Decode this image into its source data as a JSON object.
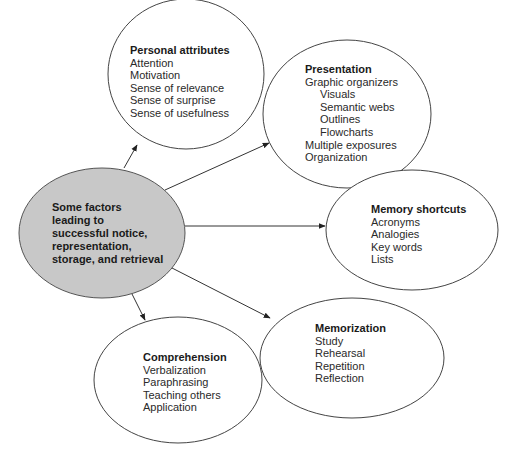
{
  "center": {
    "lines": [
      "Some factors",
      "leading to",
      "successful notice,",
      "representation,",
      "storage, and retrieval"
    ],
    "fill": "#c8c8c8"
  },
  "nodes": {
    "personal": {
      "title": "Personal attributes",
      "items": [
        "Attention",
        "Motivation",
        "Sense of relevance",
        "Sense of surprise",
        "Sense of usefulness"
      ]
    },
    "presentation": {
      "title": "Presentation",
      "items": [
        "Graphic organizers",
        "Visuals",
        "Semantic webs",
        "Outlines",
        "Flowcharts",
        "Multiple exposures",
        "Organization"
      ]
    },
    "memory": {
      "title": "Memory shortcuts",
      "items": [
        "Acronyms",
        "Analogies",
        "Key words",
        "Lists"
      ]
    },
    "memorization": {
      "title": "Memorization",
      "items": [
        "Study",
        "Rehearsal",
        "Repetition",
        "Reflection"
      ]
    },
    "comprehension": {
      "title": "Comprehension",
      "items": [
        "Verbalization",
        "Paraphrasing",
        "Teaching others",
        "Application"
      ]
    }
  }
}
